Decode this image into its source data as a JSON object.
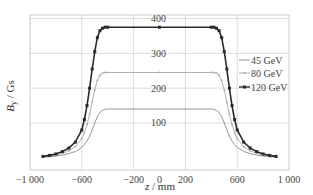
{
  "chart_data": {
    "type": "line",
    "title": "",
    "xlabel": "z / mm",
    "ylabel": "B_y / Gs",
    "xlim": [
      -1000,
      1000
    ],
    "ylim": [
      -35,
      410
    ],
    "grid": true,
    "legend_position": "right-middle, inside plot",
    "xticks": [
      -1000,
      -600,
      -200,
      0,
      200,
      600,
      1000
    ],
    "xtick_labels": [
      "−1 000",
      "−600",
      "−200",
      "0",
      "200",
      "600",
      "1 000"
    ],
    "yticks": [
      100,
      200,
      300,
      400
    ],
    "ytick_labels": [
      "100",
      "200",
      "300",
      "400"
    ],
    "ytick_label_position": "at z = 0",
    "x": [
      -900,
      -850,
      -800,
      -750,
      -700,
      -650,
      -600,
      -580,
      -560,
      -540,
      -520,
      -500,
      -480,
      -460,
      -440,
      -420,
      -400,
      0,
      400,
      420,
      440,
      460,
      480,
      500,
      520,
      540,
      560,
      580,
      600,
      650,
      700,
      750,
      800,
      850,
      900
    ],
    "series": [
      {
        "name": "45 GeV",
        "style": "thin gray line, no markers",
        "color": "#8a8a8a",
        "values": [
          2,
          3,
          5,
          8,
          12,
          18,
          30,
          38,
          48,
          62,
          80,
          100,
          118,
          130,
          136,
          139,
          140,
          140,
          140,
          139,
          136,
          130,
          118,
          100,
          80,
          62,
          48,
          38,
          30,
          18,
          12,
          8,
          5,
          3,
          2
        ]
      },
      {
        "name": "80 GeV",
        "style": "light gray line with small dot markers",
        "color": "#a8a8a8",
        "values": [
          3,
          5,
          8,
          13,
          20,
          32,
          55,
          72,
          95,
          125,
          160,
          195,
          222,
          237,
          243,
          245,
          245,
          245,
          245,
          245,
          243,
          237,
          222,
          195,
          160,
          125,
          95,
          72,
          55,
          32,
          20,
          13,
          8,
          5,
          3
        ]
      },
      {
        "name": "120 GeV",
        "style": "dark line with square markers",
        "color": "#2a2a2a",
        "values": [
          4,
          7,
          11,
          18,
          28,
          45,
          80,
          110,
          150,
          200,
          255,
          305,
          345,
          365,
          372,
          375,
          375,
          375,
          375,
          375,
          372,
          365,
          345,
          305,
          255,
          200,
          150,
          110,
          80,
          45,
          28,
          18,
          11,
          7,
          4
        ]
      }
    ]
  },
  "legend": {
    "items": [
      {
        "label": "45 GeV"
      },
      {
        "label": "80 GeV"
      },
      {
        "label": "120 GeV"
      }
    ]
  },
  "axes": {
    "xlabel_italic": "z",
    "xlabel_rest": " / mm",
    "ylabel_italic": "B",
    "ylabel_sub": "y",
    "ylabel_rest": " / Gs"
  },
  "colors": {
    "grid": "#cfcfcf",
    "frame": "#bdbdbd"
  }
}
